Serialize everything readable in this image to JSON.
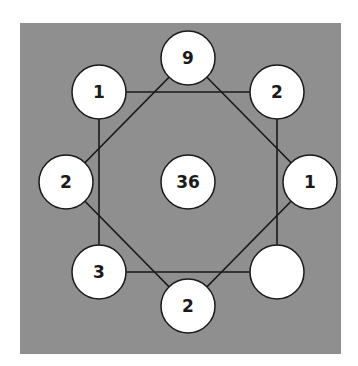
{
  "puzzle": {
    "background_color": "#8f8f8f",
    "circle_fill": "#ffffff",
    "line_color": "#1a1a1a",
    "nodes": {
      "top": {
        "value": "9"
      },
      "top_left": {
        "value": "1"
      },
      "top_right": {
        "value": "2"
      },
      "left": {
        "value": "2"
      },
      "center": {
        "value": "36"
      },
      "right": {
        "value": "1"
      },
      "bottom_left": {
        "value": "3"
      },
      "bottom": {
        "value": "2"
      },
      "bottom_right": {
        "value": ""
      }
    }
  }
}
